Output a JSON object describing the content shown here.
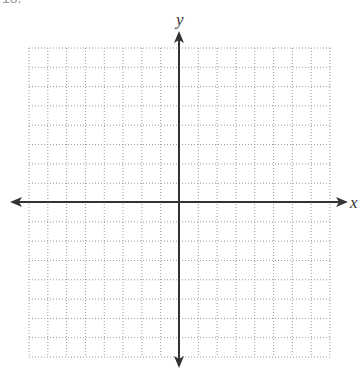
{
  "problem_number": "18.",
  "grid": {
    "columns": 16,
    "rows": 16,
    "left": 29,
    "top": 48,
    "right": 330,
    "bottom": 357,
    "line_color": "#9a9a9a",
    "line_style": "dotted"
  },
  "axes": {
    "x_label": "x",
    "y_label": "y",
    "origin_px": [
      179,
      202
    ],
    "color": "#333333"
  }
}
